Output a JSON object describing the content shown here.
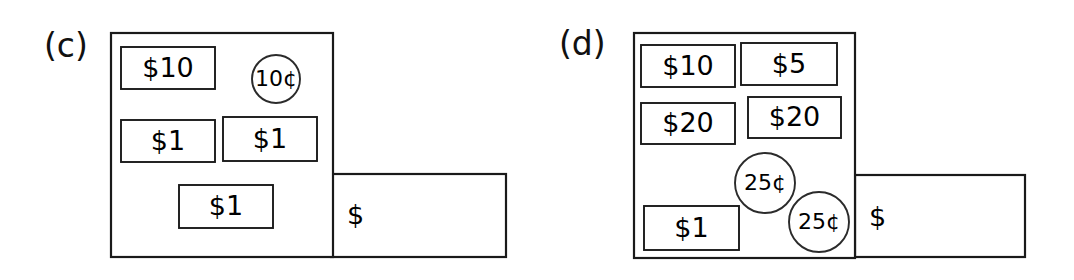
{
  "figure": {
    "background_color": "#ffffff",
    "line_color": "#1a1a1a",
    "text_color": "#000000",
    "width": 1074,
    "height": 280
  },
  "panels": [
    {
      "id": "panel-c",
      "label": "(c)",
      "label_x": 44,
      "label_y": 57,
      "wallet": {
        "main_compartment": {
          "x": 111,
          "y": 33,
          "w": 222,
          "h": 224
        },
        "side_compartment": {
          "x": 331,
          "y": 174,
          "w": 175,
          "h": 83
        },
        "side_compartment_label": "$",
        "side_label_x": 347,
        "side_label_y": 216
      },
      "bills": [
        {
          "label": "$10",
          "x": 121,
          "y": 47,
          "w": 94,
          "h": 42
        },
        {
          "label": "$1",
          "x": 121,
          "y": 120,
          "w": 94,
          "h": 42
        },
        {
          "label": "$1",
          "x": 223,
          "y": 117,
          "w": 94,
          "h": 44
        },
        {
          "label": "$1",
          "x": 179,
          "y": 185,
          "w": 94,
          "h": 43
        }
      ],
      "coins": [
        {
          "label": "10¢",
          "cx": 276,
          "cy": 79,
          "r": 24
        }
      ]
    },
    {
      "id": "panel-d",
      "label": "(d)",
      "label_x": 559,
      "label_y": 55,
      "wallet": {
        "main_compartment": {
          "x": 634,
          "y": 33,
          "w": 221,
          "h": 225
        },
        "side_compartment": {
          "x": 855,
          "y": 175,
          "w": 170,
          "h": 82
        },
        "side_compartment_label": "$",
        "side_label_x": 869,
        "side_label_y": 218
      },
      "bills": [
        {
          "label": "$10",
          "x": 641,
          "y": 45,
          "w": 94,
          "h": 42
        },
        {
          "label": "$5",
          "x": 741,
          "y": 43,
          "w": 96,
          "h": 42
        },
        {
          "label": "$20",
          "x": 641,
          "y": 103,
          "w": 94,
          "h": 41
        },
        {
          "label": "$20",
          "x": 748,
          "y": 97,
          "w": 93,
          "h": 41
        },
        {
          "label": "$1",
          "x": 644,
          "y": 206,
          "w": 95,
          "h": 44
        }
      ],
      "coins": [
        {
          "label": "25¢",
          "cx": 765,
          "cy": 183,
          "r": 30
        },
        {
          "label": "25¢",
          "cx": 819,
          "cy": 222,
          "r": 30
        }
      ]
    }
  ]
}
